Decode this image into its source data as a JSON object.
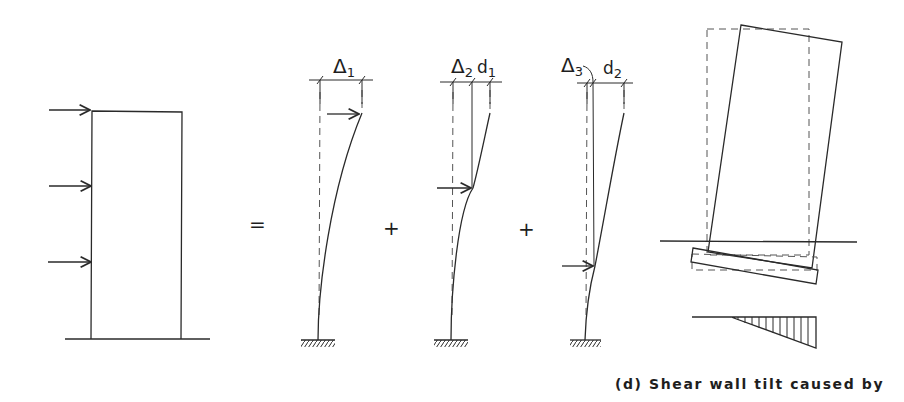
{
  "figure": {
    "operators": {
      "equals": "=",
      "plus_1": "+",
      "plus_2": "+"
    },
    "cantilever_1": {
      "delta_symbol": "Δ",
      "delta_sub": "1"
    },
    "cantilever_2": {
      "delta_symbol": "Δ",
      "delta_sub": "2",
      "d_symbol": "d",
      "d_sub": "1"
    },
    "cantilever_3": {
      "delta_symbol": "Δ",
      "delta_sub": "3",
      "d_symbol": "d",
      "d_sub": "2"
    },
    "caption": "(d)  Shear wall tilt caused by",
    "colors": {
      "line": "#2a2a2a",
      "dashed": "#555555",
      "background": "#ffffff"
    }
  }
}
